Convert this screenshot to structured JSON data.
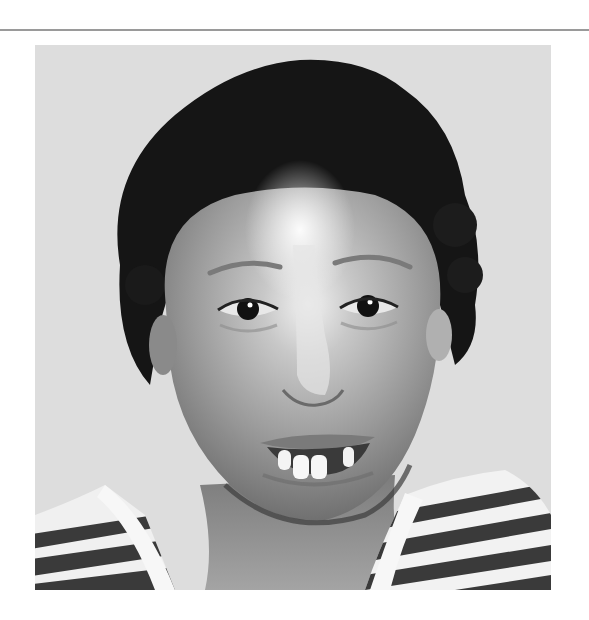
{
  "figure": {
    "kind": "photograph",
    "palette": {
      "background": "#dcdcdc",
      "hair": "#161616",
      "skin_light": "#d9d9d9",
      "skin_mid": "#9c9c9c",
      "skin_dark": "#6e6e6e",
      "stripe_dark": "#3a3a3a",
      "stripe_light": "#f2f2f2",
      "rule": "#9a9a9a"
    }
  }
}
